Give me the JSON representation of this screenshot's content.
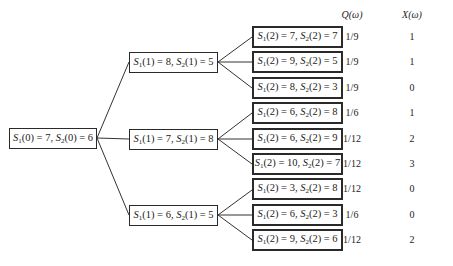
{
  "headers": {
    "q": "Q(ω)",
    "x": "X(ω)"
  },
  "root": {
    "s1": "0",
    "v1": "7",
    "s2": "0",
    "v2": "6"
  },
  "mid": [
    {
      "t": "1",
      "v1": "8",
      "v2": "5"
    },
    {
      "t": "1",
      "v1": "7",
      "v2": "8"
    },
    {
      "t": "1",
      "v1": "6",
      "v2": "5"
    }
  ],
  "leaves": [
    {
      "t": "2",
      "v1": "7",
      "v2": "7",
      "q": "1/9",
      "x": "1"
    },
    {
      "t": "2",
      "v1": "9",
      "v2": "5",
      "q": "1/9",
      "x": "1"
    },
    {
      "t": "2",
      "v1": "8",
      "v2": "3",
      "q": "1/9",
      "x": "0"
    },
    {
      "t": "2",
      "v1": "6",
      "v2": "8",
      "q": "1/6",
      "x": "1"
    },
    {
      "t": "2",
      "v1": "6",
      "v2": "9",
      "q": "1/12",
      "x": "2"
    },
    {
      "t": "2",
      "v1": "10",
      "v2": "7",
      "q": "1/12",
      "x": "3"
    },
    {
      "t": "2",
      "v1": "3",
      "v2": "8",
      "q": "1/12",
      "x": "0"
    },
    {
      "t": "2",
      "v1": "6",
      "v2": "3",
      "q": "1/6",
      "x": "0"
    },
    {
      "t": "2",
      "v1": "9",
      "v2": "6",
      "q": "1/12",
      "x": "2"
    }
  ]
}
